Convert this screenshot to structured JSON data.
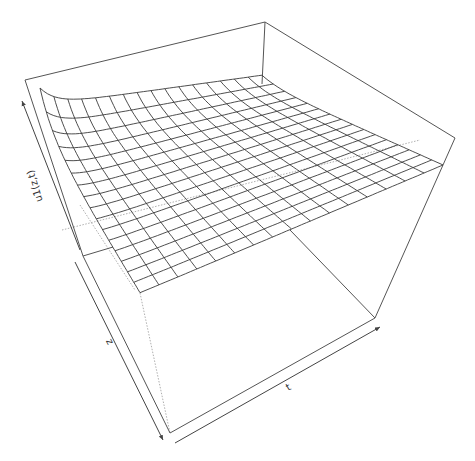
{
  "chart_data": {
    "type": "surface",
    "title": "",
    "xlabel": "t",
    "ylabel": "z",
    "zlabel": "u1(z,t)",
    "grid_rows": 16,
    "grid_cols": 16,
    "ticks": false,
    "box": true,
    "colors": {
      "mesh": "#3a3a3a",
      "box": "#555555",
      "background": "#ffffff"
    }
  },
  "labels": {
    "t_axis": "t",
    "z_axis": "z",
    "u_axis": "u1(z,t)"
  }
}
